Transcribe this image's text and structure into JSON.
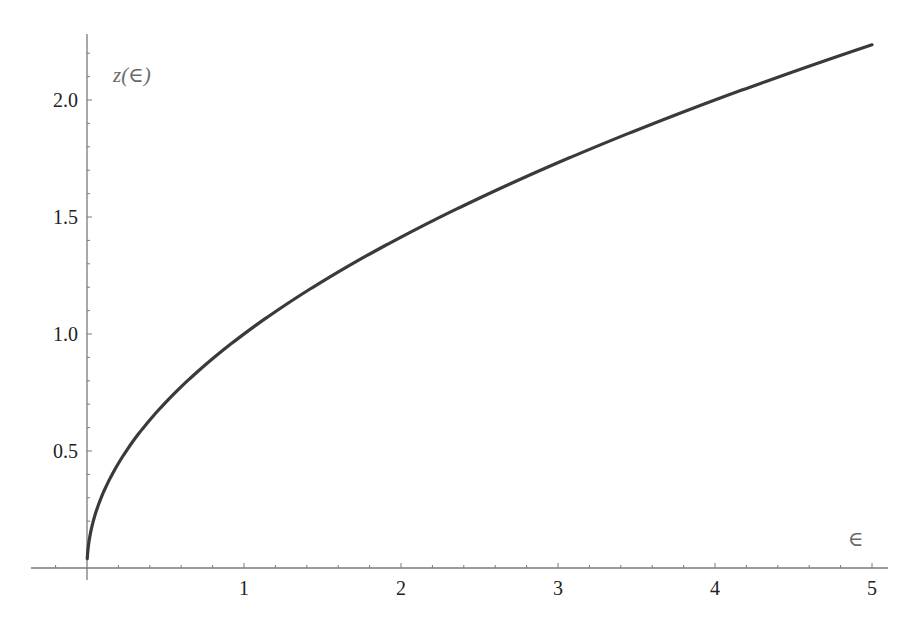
{
  "chart_data": {
    "type": "line",
    "title": "",
    "xlabel": "∈",
    "ylabel": "z(∈)",
    "xlim": [
      -0.35,
      5.1
    ],
    "ylim": [
      0,
      2.29
    ],
    "grid": false,
    "legend": null,
    "x_ticks": [
      1,
      2,
      3,
      4,
      5
    ],
    "x_tick_labels": [
      "1",
      "2",
      "3",
      "4",
      "5"
    ],
    "y_ticks": [
      0.5,
      1.0,
      1.5,
      2.0
    ],
    "y_tick_labels": [
      "0.5",
      "1.0",
      "1.5",
      "2.0"
    ],
    "series": [
      {
        "name": "z(∈) = √∈",
        "color": "#3a3a3a",
        "x": [
          0.0016,
          0.01,
          0.05,
          0.1,
          0.2,
          0.3,
          0.5,
          0.75,
          1.0,
          1.5,
          2.0,
          2.5,
          3.0,
          3.5,
          4.0,
          4.5,
          5.0
        ],
        "values": [
          0.04,
          0.1,
          0.224,
          0.316,
          0.447,
          0.548,
          0.707,
          0.866,
          1.0,
          1.225,
          1.414,
          1.581,
          1.732,
          1.871,
          2.0,
          2.121,
          2.236
        ]
      }
    ]
  },
  "axes": {
    "x_label": "∈",
    "y_label": "z(∈)",
    "axis_color": "#7a7a7a",
    "curve_color": "#3a3a3a"
  }
}
